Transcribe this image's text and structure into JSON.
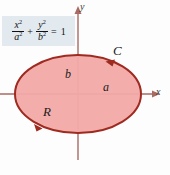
{
  "figure": {
    "background_color": "#fdfdfd"
  },
  "equation": {
    "box_color": "#e2eaf0",
    "text": "x^2/a^2 + y^2/b^2 = 1",
    "num1": "x",
    "num1_exp": "2",
    "den1": "a",
    "den1_exp": "2",
    "operator": "+",
    "num2": "y",
    "num2_exp": "2",
    "den2": "b",
    "den2_exp": "2",
    "equals": "=",
    "rhs": "1"
  },
  "axes": {
    "x_label": "x",
    "y_label": "y",
    "axis_color": "#a86a62",
    "x_axis_y": 94,
    "y_axis_x": 78
  },
  "ellipse": {
    "center_x": 78,
    "center_y": 94,
    "radius_x": 63,
    "radius_y": 39,
    "fill_color": "#f2aaa8",
    "stroke_color": "#9e2a20",
    "orientation": "counterclockwise"
  },
  "labels": {
    "curve": "C",
    "region": "R",
    "semi_major": "a",
    "semi_minor": "b"
  },
  "markers": {
    "arrow_top_right": "counterclockwise-arrow",
    "arrow_bottom_left": "counterclockwise-arrow"
  },
  "caption": {
    "text": ""
  }
}
